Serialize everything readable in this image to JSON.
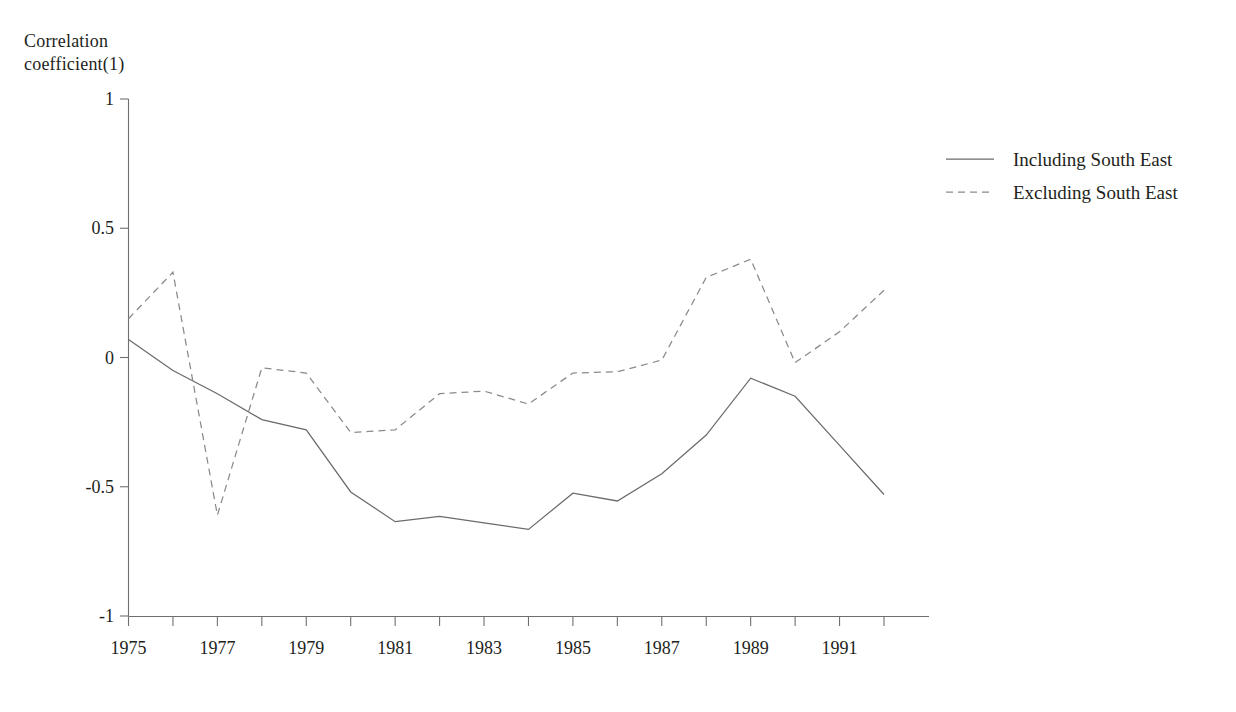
{
  "chart_data": {
    "type": "line",
    "title": "",
    "subtitle": "",
    "xlabel": "",
    "ylabel": "Correlation\ncoefficient(1)",
    "ylim": [
      -1,
      1
    ],
    "yticks": [
      1,
      0.5,
      0,
      -0.5,
      -1
    ],
    "ytick_labels": [
      "1",
      "0.5",
      "0",
      "-0.5",
      "-1"
    ],
    "xlim": [
      1975,
      1992
    ],
    "x": [
      1975,
      1976,
      1977,
      1978,
      1979,
      1980,
      1981,
      1982,
      1983,
      1984,
      1985,
      1986,
      1987,
      1988,
      1989,
      1990,
      1991,
      1992
    ],
    "xticks": [
      1975,
      1976,
      1977,
      1978,
      1979,
      1980,
      1981,
      1982,
      1983,
      1984,
      1985,
      1986,
      1987,
      1988,
      1989,
      1990,
      1991,
      1992
    ],
    "xtick_labels": [
      "1975",
      "",
      "1977",
      "",
      "1979",
      "",
      "1981",
      "",
      "1983",
      "",
      "1985",
      "",
      "1987",
      "",
      "1989",
      "",
      "1991",
      ""
    ],
    "grid": false,
    "legend_position": "top-right",
    "series": [
      {
        "name": "Including South East",
        "style": "solid",
        "color": "#6b6b6b",
        "values": [
          0.07,
          -0.05,
          -0.14,
          -0.24,
          -0.28,
          -0.52,
          -0.635,
          -0.615,
          -0.64,
          -0.665,
          -0.525,
          -0.555,
          -0.45,
          -0.3,
          -0.08,
          -0.15,
          -0.34,
          -0.53
        ]
      },
      {
        "name": "Excluding South East",
        "style": "dashed",
        "color": "#8a8a8a",
        "values": [
          0.15,
          0.33,
          -0.61,
          -0.04,
          -0.06,
          -0.29,
          -0.28,
          -0.14,
          -0.13,
          -0.18,
          -0.06,
          -0.055,
          -0.01,
          0.31,
          0.38,
          -0.02,
          0.1,
          0.26
        ]
      }
    ]
  },
  "legend": {
    "items": [
      {
        "label": "Including South East",
        "style": "solid"
      },
      {
        "label": "Excluding South East",
        "style": "dashed"
      }
    ]
  },
  "axes": {
    "y_axis_caption": "Correlation\ncoefficient(1)"
  }
}
